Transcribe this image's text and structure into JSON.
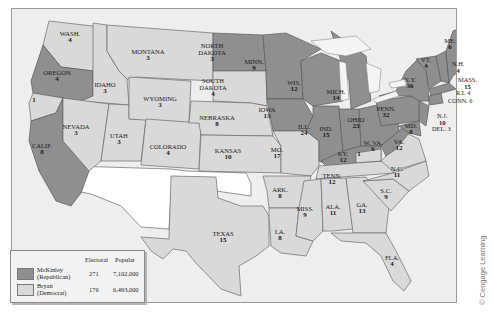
{
  "map": {
    "title": "Presidential Election of 1896",
    "credit": "© Cengage Learning",
    "colors": {
      "republican": "#8f8f8f",
      "democrat": "#d9d9d9",
      "territory": "#ffffff",
      "water": "#eeeeee"
    }
  },
  "legend": {
    "headers": {
      "electoral": "Electoral",
      "popular": "Popular"
    },
    "entries": [
      {
        "name": "McKinley",
        "party": "(Republican)",
        "electoral": "271",
        "popular": "7,102,000",
        "color": "#8f8f8f"
      },
      {
        "name": "Bryan",
        "party": "(Democrat)",
        "electoral": "176",
        "popular": "6,493,000",
        "color": "#d9d9d9"
      }
    ]
  },
  "states": {
    "wash": {
      "name": "WASH.",
      "votes": "4",
      "winner": "Bryan"
    },
    "oregon": {
      "name": "OREGON",
      "votes": "4",
      "winner": "McKinley"
    },
    "calif": {
      "name": "CALIF.",
      "votes": "8",
      "winner": "McKinley"
    },
    "calif_split": {
      "name": "",
      "votes": "1",
      "winner": "Bryan"
    },
    "idaho": {
      "name": "IDAHO",
      "votes": "3",
      "winner": "Bryan"
    },
    "nevada": {
      "name": "NEVADA",
      "votes": "3",
      "winner": "Bryan"
    },
    "montana": {
      "name": "MONTANA",
      "votes": "3",
      "winner": "Bryan"
    },
    "wyoming": {
      "name": "WYOMING",
      "votes": "3",
      "winner": "Bryan"
    },
    "utah": {
      "name": "UTAH",
      "votes": "3",
      "winner": "Bryan"
    },
    "colorado": {
      "name": "COLORADO",
      "votes": "4",
      "winner": "Bryan"
    },
    "north_dakota": {
      "name": "NORTH DAKOTA",
      "line1": "NORTH",
      "line2": "DAKOTA",
      "votes": "3",
      "winner": "McKinley"
    },
    "south_dakota": {
      "name": "SOUTH DAKOTA",
      "line1": "SOUTH",
      "line2": "DAKOTA",
      "votes": "4",
      "winner": "Bryan"
    },
    "nebraska": {
      "name": "NEBRASKA",
      "votes": "8",
      "winner": "Bryan"
    },
    "kansas": {
      "name": "KANSAS",
      "votes": "10",
      "winner": "Bryan"
    },
    "texas": {
      "name": "TEXAS",
      "votes": "15",
      "winner": "Bryan"
    },
    "minn": {
      "name": "MINN.",
      "votes": "9",
      "winner": "McKinley"
    },
    "iowa": {
      "name": "IOWA",
      "votes": "13",
      "winner": "McKinley"
    },
    "mo": {
      "name": "MO.",
      "votes": "17",
      "winner": "Bryan"
    },
    "ark": {
      "name": "ARK.",
      "votes": "8",
      "winner": "Bryan"
    },
    "la": {
      "name": "LA.",
      "votes": "8",
      "winner": "Bryan"
    },
    "wis": {
      "name": "WIS.",
      "votes": "12",
      "winner": "McKinley"
    },
    "ill": {
      "name": "ILL.",
      "votes": "24",
      "winner": "McKinley"
    },
    "mich": {
      "name": "MICH.",
      "votes": "14",
      "winner": "McKinley"
    },
    "ind": {
      "name": "IND.",
      "votes": "15",
      "winner": "McKinley"
    },
    "ohio": {
      "name": "OHIO",
      "votes": "23",
      "winner": "McKinley"
    },
    "ky": {
      "name": "KY.",
      "votes": "12",
      "winner": "McKinley"
    },
    "ky_split": {
      "name": "",
      "votes": "1",
      "winner": "Bryan"
    },
    "tenn": {
      "name": "TENN.",
      "votes": "12",
      "winner": "Bryan"
    },
    "miss": {
      "name": "MISS.",
      "votes": "9",
      "winner": "Bryan"
    },
    "ala": {
      "name": "ALA.",
      "votes": "11",
      "winner": "Bryan"
    },
    "ga": {
      "name": "GA.",
      "votes": "13",
      "winner": "Bryan"
    },
    "fla": {
      "name": "FLA.",
      "votes": "4",
      "winner": "Bryan"
    },
    "sc": {
      "name": "S.C.",
      "votes": "9",
      "winner": "Bryan"
    },
    "nc": {
      "name": "N.C.",
      "votes": "11",
      "winner": "Bryan"
    },
    "va": {
      "name": "VA.",
      "votes": "12",
      "winner": "Bryan"
    },
    "wva": {
      "name": "W. VA.",
      "votes": "6",
      "winner": "McKinley"
    },
    "md": {
      "name": "MD.",
      "votes": "8",
      "winner": "McKinley"
    },
    "del": {
      "name": "DEL.",
      "votes": "3",
      "winner": "McKinley",
      "label": "DEL. 3"
    },
    "nj": {
      "name": "N.J.",
      "votes": "10",
      "winner": "McKinley"
    },
    "penn": {
      "name": "PENN.",
      "votes": "32",
      "winner": "McKinley"
    },
    "ny": {
      "name": "N.Y.",
      "votes": "36",
      "winner": "McKinley"
    },
    "vt": {
      "name": "VT.",
      "votes": "4",
      "winner": "McKinley"
    },
    "nh": {
      "name": "N.H.",
      "votes": "4",
      "winner": "McKinley"
    },
    "me": {
      "name": "ME.",
      "votes": "6",
      "winner": "McKinley"
    },
    "mass": {
      "name": "MASS.",
      "votes": "15",
      "winner": "McKinley"
    },
    "ri": {
      "name": "R.I.",
      "votes": "4",
      "winner": "McKinley",
      "label": "R.I. 4"
    },
    "conn": {
      "name": "CONN.",
      "votes": "6",
      "winner": "McKinley",
      "label": "CONN. 6"
    }
  }
}
